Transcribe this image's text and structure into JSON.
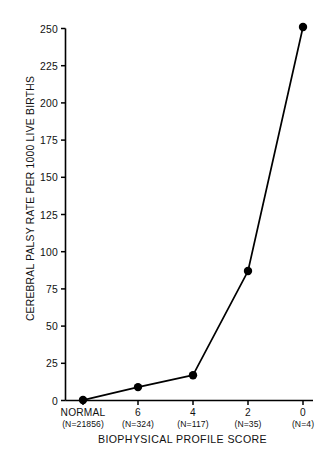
{
  "chart_data": {
    "type": "line",
    "title": "",
    "xlabel": "BIOPHYSICAL PROFILE SCORE",
    "ylabel": "CEREBRAL PALSY RATE PER 1000 LIVE BIRTHS",
    "categories": [
      "NORMAL",
      "6",
      "4",
      "2",
      "0"
    ],
    "category_sublabels": [
      "(N=21856)",
      "(N=324)",
      "(N=117)",
      "(N=35)",
      "(N=4)"
    ],
    "values": [
      0.3,
      9,
      17,
      87,
      251
    ],
    "ylim": [
      0,
      250
    ],
    "ytick_labels": [
      "0",
      "25",
      "50",
      "75",
      "100",
      "125",
      "150",
      "175",
      "200",
      "225",
      "250"
    ],
    "ytick_values": [
      0,
      25,
      50,
      75,
      100,
      125,
      150,
      175,
      200,
      225,
      250
    ],
    "grid": false,
    "legend": "none",
    "series": [
      {
        "name": "Cerebral palsy rate",
        "values": [
          0.3,
          9,
          17,
          87,
          251
        ],
        "color": "#000000",
        "marker": "filled-circle"
      }
    ]
  },
  "colors": {
    "line": "#000000",
    "marker": "#000000",
    "axis": "#000000",
    "background": "#ffffff"
  }
}
